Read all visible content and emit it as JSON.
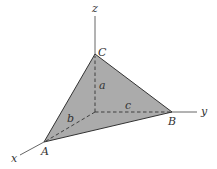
{
  "diagram": {
    "type": "tetrahedron-octant",
    "fill_color": "#ababab",
    "axes": {
      "x": "x",
      "y": "y",
      "z": "z"
    },
    "vertices": {
      "A": "A",
      "B": "B",
      "C": "C"
    },
    "lengths": {
      "a": "a",
      "b": "b",
      "c": "c"
    }
  }
}
